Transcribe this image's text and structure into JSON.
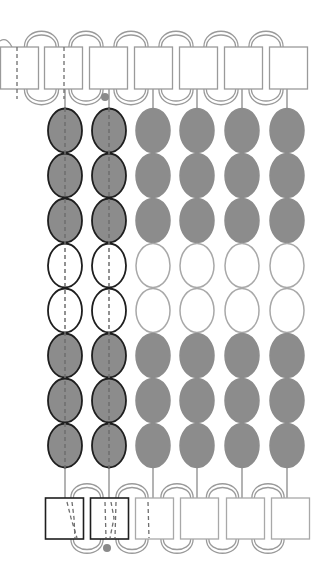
{
  "diagram": {
    "colors": {
      "filled_bead": "#8c8c8c",
      "empty_bead": "#ffffff",
      "highlight_outline": "#1e1e1e",
      "muted_outline": "#a8a8a8",
      "frame_line": "#9a9a9a",
      "thread_dash": "#6e6e6e",
      "knot_dot": "#8a8a8a"
    },
    "top_frames": {
      "y": 47,
      "height": 42,
      "width": 39,
      "x": [
        0,
        44,
        89,
        134,
        179,
        224,
        269
      ],
      "dashed_thread_in": [
        0,
        1
      ]
    },
    "bottom_frames": {
      "y": 498,
      "height": 41,
      "width": 39,
      "x": [
        45,
        90,
        135,
        180,
        226,
        271
      ],
      "highlighted": [
        0,
        1
      ],
      "dashed_thread_in": [
        0,
        1,
        2
      ]
    },
    "bead_columns": {
      "centers_x": [
        65,
        109,
        153,
        197,
        242,
        287
      ],
      "highlighted": [
        0,
        1
      ],
      "bead_width": 34,
      "bead_height": 45,
      "start_y": 108,
      "rows": [
        "filled",
        "filled",
        "filled",
        "empty",
        "empty",
        "filled",
        "filled",
        "filled"
      ]
    },
    "knots": [
      {
        "x": 105,
        "y": 97
      },
      {
        "x": 107,
        "y": 548
      }
    ]
  }
}
